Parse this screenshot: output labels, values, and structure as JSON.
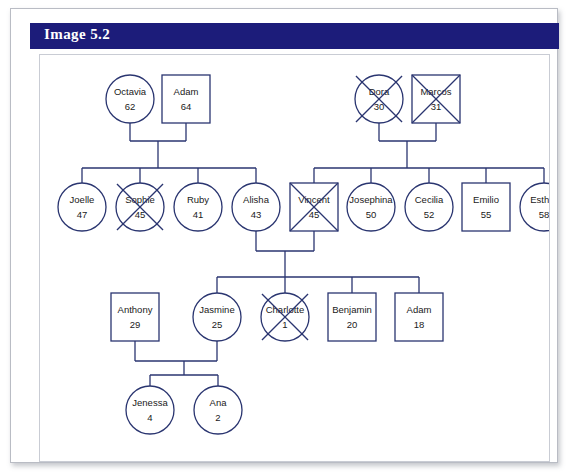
{
  "header": {
    "title": "Image 5.2"
  },
  "diagram": {
    "type": "genogram",
    "legend": {
      "circle": "female",
      "square": "male",
      "x_overlay": "deceased"
    },
    "generations": [
      {
        "index": 1,
        "people": [
          {
            "id": "octavia",
            "name": "Octavia",
            "age": "62",
            "shape": "circle",
            "deceased": false,
            "cx": 90,
            "cy": 44,
            "r": 24
          },
          {
            "id": "adam64",
            "name": "Adam",
            "age": "64",
            "shape": "square",
            "deceased": false,
            "cx": 146,
            "cy": 44,
            "r": 24
          },
          {
            "id": "dora",
            "name": "Dora",
            "age": "30",
            "shape": "circle",
            "deceased": true,
            "cx": 339,
            "cy": 44,
            "r": 24
          },
          {
            "id": "marcos",
            "name": "Marcos",
            "age": "31",
            "shape": "square",
            "deceased": true,
            "cx": 396,
            "cy": 44,
            "r": 24
          }
        ]
      },
      {
        "index": 2,
        "people": [
          {
            "id": "joelle",
            "name": "Joelle",
            "age": "47",
            "shape": "circle",
            "deceased": false,
            "cx": 42,
            "cy": 152,
            "r": 24
          },
          {
            "id": "sophie",
            "name": "Sophie",
            "age": "45",
            "shape": "circle",
            "deceased": true,
            "cx": 100,
            "cy": 152,
            "r": 24
          },
          {
            "id": "ruby",
            "name": "Ruby",
            "age": "41",
            "shape": "circle",
            "deceased": false,
            "cx": 158,
            "cy": 152,
            "r": 24
          },
          {
            "id": "alisha",
            "name": "Alisha",
            "age": "43",
            "shape": "circle",
            "deceased": false,
            "cx": 216,
            "cy": 152,
            "r": 24
          },
          {
            "id": "vincent",
            "name": "Vincent",
            "age": "45",
            "shape": "square",
            "deceased": true,
            "cx": 274,
            "cy": 152,
            "r": 24
          },
          {
            "id": "josephina",
            "name": "Josephina",
            "age": "50",
            "shape": "circle",
            "deceased": false,
            "cx": 331,
            "cy": 152,
            "r": 24
          },
          {
            "id": "cecilia",
            "name": "Cecilia",
            "age": "52",
            "shape": "circle",
            "deceased": false,
            "cx": 389,
            "cy": 152,
            "r": 24
          },
          {
            "id": "emilio",
            "name": "Emilio",
            "age": "55",
            "shape": "square",
            "deceased": false,
            "cx": 446,
            "cy": 152,
            "r": 24
          },
          {
            "id": "esther",
            "name": "Esther",
            "age": "58",
            "shape": "circle",
            "deceased": false,
            "cx": 504,
            "cy": 152,
            "r": 24
          }
        ]
      },
      {
        "index": 3,
        "people": [
          {
            "id": "anthony",
            "name": "Anthony",
            "age": "29",
            "shape": "square",
            "deceased": false,
            "cx": 95,
            "cy": 262,
            "r": 24
          },
          {
            "id": "jasmine",
            "name": "Jasmine",
            "age": "25",
            "shape": "circle",
            "deceased": false,
            "cx": 177,
            "cy": 262,
            "r": 24
          },
          {
            "id": "charlotte",
            "name": "Charlotte",
            "age": "1",
            "shape": "circle",
            "deceased": true,
            "cx": 245,
            "cy": 262,
            "r": 24
          },
          {
            "id": "benjamin",
            "name": "Benjamin",
            "age": "20",
            "shape": "square",
            "deceased": false,
            "cx": 312,
            "cy": 262,
            "r": 24
          },
          {
            "id": "adam18",
            "name": "Adam",
            "age": "18",
            "shape": "square",
            "deceased": false,
            "cx": 379,
            "cy": 262,
            "r": 24
          }
        ]
      },
      {
        "index": 4,
        "people": [
          {
            "id": "jenessa",
            "name": "Jenessa",
            "age": "4",
            "shape": "circle",
            "deceased": false,
            "cx": 110,
            "cy": 355,
            "r": 24
          },
          {
            "id": "ana",
            "name": "Ana",
            "age": "2",
            "shape": "circle",
            "deceased": false,
            "cx": 178,
            "cy": 355,
            "r": 24
          }
        ]
      }
    ],
    "unions": [
      {
        "id": "octavia-adam64",
        "partners": [
          "octavia",
          "adam64"
        ],
        "couple_bar_y": 86,
        "stem_x": 118,
        "sibling_bar_y": 113,
        "children": [
          "joelle",
          "sophie",
          "ruby",
          "alisha"
        ]
      },
      {
        "id": "dora-marcos",
        "partners": [
          "dora",
          "marcos"
        ],
        "couple_bar_y": 86,
        "stem_x": 367,
        "sibling_bar_y": 113,
        "children": [
          "vincent",
          "josephina",
          "cecilia",
          "emilio",
          "esther"
        ]
      },
      {
        "id": "alisha-vincent",
        "partners": [
          "alisha",
          "vincent"
        ],
        "couple_bar_y": 196,
        "stem_x": 245,
        "sibling_bar_y": 222,
        "children": [
          "jasmine",
          "charlotte",
          "benjamin",
          "adam18"
        ]
      },
      {
        "id": "anthony-jasmine",
        "partners": [
          "anthony",
          "jasmine"
        ],
        "couple_bar_y": 306,
        "stem_x": 144,
        "sibling_bar_y": 320,
        "children": [
          "jenessa",
          "ana"
        ]
      }
    ]
  },
  "colors": {
    "header_bg": "#1c1c7a",
    "header_text": "#ffffff",
    "stroke": "#2a3570",
    "node_fill": "#ffffff",
    "page_bg": "#ffffff",
    "card_border": "#b9bcc4"
  }
}
